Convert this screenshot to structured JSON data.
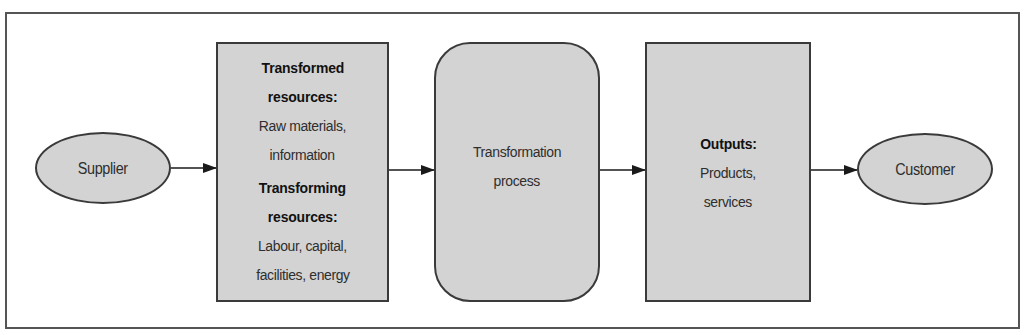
{
  "diagram": {
    "type": "process-flow",
    "nodes": {
      "supplier": {
        "label": "Supplier"
      },
      "inputs": {
        "transformed_heading": "Transformed",
        "transformed_heading2": "resources:",
        "transformed_items_line1": "Raw materials,",
        "transformed_items_line2": "information",
        "transforming_heading": "Transforming",
        "transforming_heading2": "resources:",
        "transforming_items_line1": "Labour, capital,",
        "transforming_items_line2": "facilities, energy"
      },
      "process": {
        "line1": "Transformation",
        "line2": "process"
      },
      "outputs": {
        "heading": "Outputs:",
        "line1": "Products,",
        "line2": "services"
      },
      "customer": {
        "label": "Customer"
      }
    },
    "edges": [
      {
        "from": "supplier",
        "to": "inputs"
      },
      {
        "from": "inputs",
        "to": "process"
      },
      {
        "from": "process",
        "to": "outputs"
      },
      {
        "from": "outputs",
        "to": "customer"
      }
    ],
    "colors": {
      "node_fill": "#d3d3d3",
      "node_border": "#3a3a3a",
      "frame_border": "#555555",
      "arrow": "#1a1a1a"
    }
  }
}
